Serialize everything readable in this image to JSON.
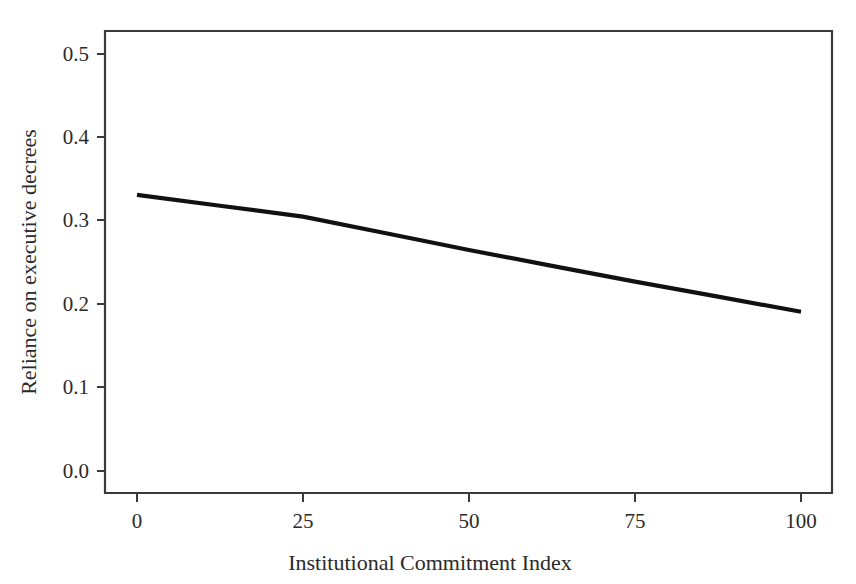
{
  "chart_data": {
    "type": "line",
    "title": "",
    "subtitle": "",
    "xlabel": "Institutional Commitment Index",
    "ylabel": "Reliance on executive decrees",
    "xlim": [
      0,
      100
    ],
    "ylim": [
      0.0,
      0.52
    ],
    "xticks": [
      0,
      25,
      50,
      75,
      100
    ],
    "xtick_labels": [
      "0",
      "25",
      "50",
      "75",
      "100"
    ],
    "yticks": [
      0.0,
      0.1,
      0.2,
      0.3,
      0.4,
      0.5
    ],
    "ytick_labels": [
      "0.0",
      "0.1",
      "0.2",
      "0.3",
      "0.4",
      "0.5"
    ],
    "grid": false,
    "legend": false,
    "legend_position": "none",
    "frame": "box",
    "series": [
      {
        "name": "Predicted reliance on executive decrees",
        "color": "#111111",
        "x": [
          0,
          12.5,
          25,
          37.5,
          50,
          62.5,
          75,
          87.5,
          100
        ],
        "values": [
          0.331,
          0.318,
          0.305,
          0.285,
          0.265,
          0.246,
          0.227,
          0.209,
          0.191
        ]
      }
    ],
    "annotations": []
  },
  "axes": {
    "x_axis_label": "Institutional Commitment Index",
    "y_axis_label": "Reliance on executive decrees"
  },
  "colors": {
    "background": "#ffffff",
    "line": "#111111",
    "axis": "#3a3a3a",
    "text": "#2a2a2a"
  }
}
